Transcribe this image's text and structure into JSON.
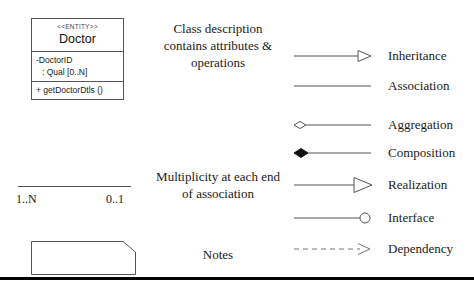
{
  "class_box": {
    "stereotype": "<<ENTITY>>",
    "name": "Doctor",
    "attributes": [
      "-DoctorID",
      ": Qual [0..N]"
    ],
    "operations": [
      "+ getDoctorDtls ()"
    ]
  },
  "descriptions": {
    "class_description": "Class description contains attributes & operations",
    "multiplicity": "Multiplicity at each end of association",
    "notes": "Notes"
  },
  "multiplicity": {
    "left_label": "1..N",
    "right_label": "0..1"
  },
  "legend": {
    "items": [
      {
        "label": "Inheritance",
        "symbol": "hollow-triangle-arrow"
      },
      {
        "label": "Association",
        "symbol": "plain-line"
      },
      {
        "label": "Aggregation",
        "symbol": "hollow-diamond-line"
      },
      {
        "label": "Composition",
        "symbol": "filled-diamond-line"
      },
      {
        "label": "Realization",
        "symbol": "large-hollow-triangle-arrow"
      },
      {
        "label": "Interface",
        "symbol": "hollow-circle-line"
      },
      {
        "label": "Dependency",
        "symbol": "dashed-open-arrow"
      }
    ]
  },
  "colors": {
    "line": "#555555",
    "ink": "#1a1a1a",
    "rule": "#000000"
  }
}
